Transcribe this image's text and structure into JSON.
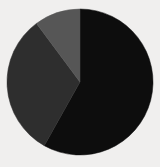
{
  "page": {
    "background_color": "#f0efee",
    "width": 160,
    "height": 167
  },
  "chart_data": {
    "type": "pie",
    "title": "",
    "subtitle": "",
    "xlabel": "",
    "ylabel": "",
    "legend": "none",
    "grid": false,
    "start_angle_deg": 0,
    "direction": "clockwise",
    "center": {
      "x": 80,
      "y": 82
    },
    "radius": 73,
    "categories": [
      "Slice 1",
      "Slice 2",
      "Slice 3"
    ],
    "values": [
      58.1,
      31.7,
      10.2
    ],
    "value_unit": "percent",
    "colors": [
      "#0d0d0d",
      "#2e2e2e",
      "#565656"
    ],
    "slices": [
      {
        "label": "Slice 1",
        "value": 58.1,
        "percent": 58.1,
        "color": "#0d0d0d",
        "start_angle_deg": 0.0,
        "end_angle_deg": 209.3
      },
      {
        "label": "Slice 2",
        "value": 31.7,
        "percent": 31.7,
        "color": "#2e2e2e",
        "start_angle_deg": 209.3,
        "end_angle_deg": 323.4
      },
      {
        "label": "Slice 3",
        "value": 10.2,
        "percent": 10.2,
        "color": "#565656",
        "start_angle_deg": 323.4,
        "end_angle_deg": 360.0
      }
    ]
  }
}
